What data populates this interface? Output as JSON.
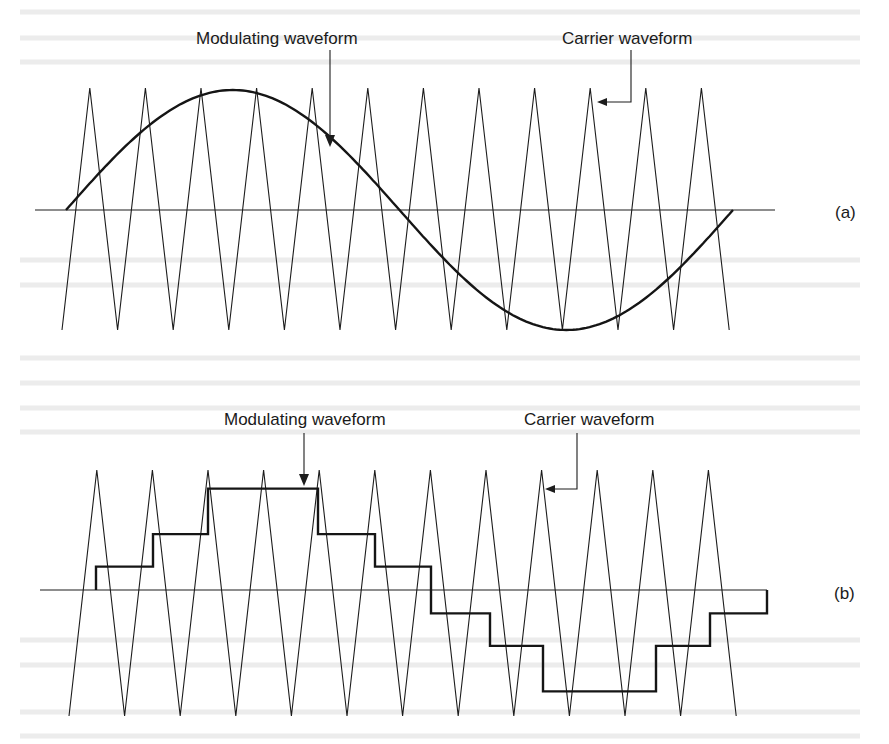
{
  "figure": {
    "panels": [
      {
        "id": "a",
        "tag": "(a)",
        "modulating_label": "Modulating waveform",
        "carrier_label": "Carrier waveform",
        "modulating_shape": "sine",
        "carrier_shape": "triangle",
        "carrier_cycles": 12,
        "modulation_index": 0.5
      },
      {
        "id": "b",
        "tag": "(b)",
        "modulating_label": "Modulating waveform",
        "carrier_label": "Carrier waveform",
        "modulating_shape": "staircase",
        "carrier_shape": "triangle",
        "carrier_cycles": 12,
        "staircase_levels": [
          0.18,
          0.43,
          0.78,
          0.43,
          0.18,
          -0.18,
          -0.43,
          -0.78,
          -0.43,
          -0.18,
          0.0
        ]
      }
    ]
  }
}
